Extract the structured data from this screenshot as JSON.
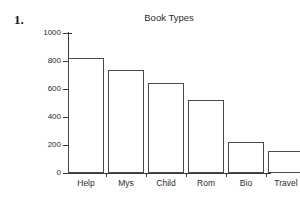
{
  "problem": {
    "number": "1."
  },
  "chart_data": {
    "type": "bar",
    "title": "Book Types",
    "xlabel": "",
    "ylabel": "",
    "categories": [
      "Help",
      "Mys",
      "Child",
      "Rom",
      "Bio",
      "Travel"
    ],
    "values": [
      820,
      735,
      645,
      525,
      220,
      155
    ],
    "ylim": [
      0,
      1000
    ],
    "yticks": [
      0,
      200,
      400,
      600,
      800,
      1000
    ],
    "ytick_labels": [
      "0",
      "200",
      "400",
      "600",
      "800",
      "1000"
    ],
    "grid": false,
    "legend": false,
    "bar_face_color": "#ffffff",
    "bar_edge_color": "#4a4a4a",
    "axis_color": "#3a3a3a",
    "background_color": "#ffffff"
  }
}
